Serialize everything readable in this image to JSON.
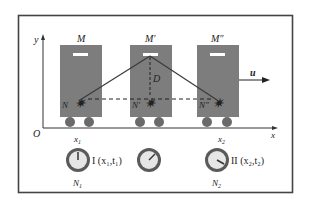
{
  "diagram": {
    "colors": {
      "frame": "#444444",
      "car_body": "#7d7d7d",
      "mirror": "#ffffff",
      "light_path": "#3a3a3a",
      "wheel": "#6a6a6a",
      "clock_ring": "#5a5a5a",
      "clock_face": "#e6e6e6",
      "text": "#222222"
    },
    "axes": {
      "origin_label": "O",
      "x_label": "x",
      "y_label": "y"
    },
    "velocity_label": "u",
    "distance_label": "D",
    "cars": [
      {
        "mirror_label": "M",
        "source_label": "N",
        "position_label": "x",
        "position_sub": "1"
      },
      {
        "mirror_label": "M′",
        "source_label": "N′",
        "position_label": "",
        "position_sub": ""
      },
      {
        "mirror_label": "M″",
        "source_label": "N″",
        "position_label": "x",
        "position_sub": "2"
      }
    ],
    "clocks": [
      {
        "name_label": "N",
        "name_sub": "1",
        "event_label": "I (x₁,t₁)"
      },
      {
        "name_label": "",
        "name_sub": "",
        "event_label": ""
      },
      {
        "name_label": "N",
        "name_sub": "2",
        "event_label": "II (x₂,t₂)"
      }
    ]
  }
}
